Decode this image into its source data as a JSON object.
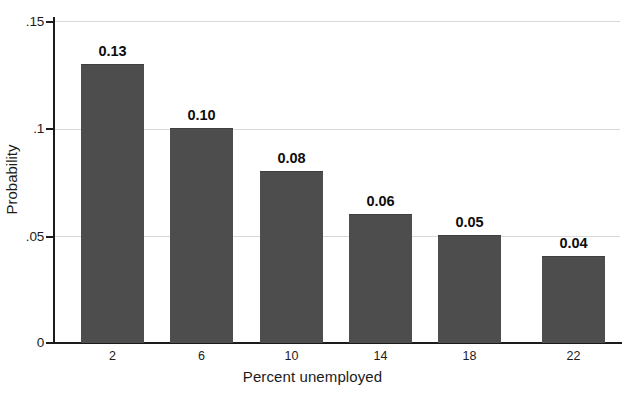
{
  "chart_data": {
    "type": "bar",
    "title": "",
    "subtitle": "",
    "xlabel": "Percent unemployed",
    "ylabel": "Probability",
    "categories": [
      "2",
      "6",
      "10",
      "14",
      "18",
      "22"
    ],
    "values": [
      0.13,
      0.1,
      0.08,
      0.06,
      0.05,
      0.04
    ],
    "data_labels": [
      "0.13",
      "0.10",
      "0.08",
      "0.06",
      "0.05",
      "0.04"
    ],
    "ylim": [
      0,
      0.155
    ],
    "ytick_values": [
      0,
      0.05,
      0.1,
      0.15
    ],
    "ytick_labels": [
      "0",
      ".05",
      ".1",
      ".15"
    ],
    "xtick_labels": [
      "2",
      "6",
      "10",
      "14",
      "18",
      "22"
    ],
    "grid": "horizontal",
    "legend": "none",
    "series": [
      {
        "name": "Probability",
        "values": [
          0.13,
          0.1,
          0.08,
          0.06,
          0.05,
          0.04
        ],
        "color": "#4d4d4d"
      }
    ],
    "colors": {
      "bar": "#4d4d4d",
      "gridline": "#d8d8d8",
      "axis": "#1b1b1b",
      "text": "#1b1b1b",
      "label_text": "#0d0d0d",
      "background": "#ffffff"
    }
  }
}
